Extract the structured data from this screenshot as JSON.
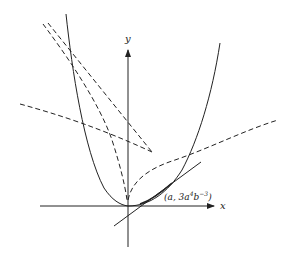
{
  "figure": {
    "axes": {
      "x_label": "x",
      "y_label": "y"
    },
    "point_label": {
      "open": "(a, 3a",
      "exp1": "4",
      "mid": "b",
      "exp2": "−3",
      "close": ")"
    },
    "elements": [
      {
        "name": "parabola-curve",
        "style": "solid"
      },
      {
        "name": "tangent-line",
        "style": "solid"
      },
      {
        "name": "dashed-curve-right",
        "style": "dashed"
      },
      {
        "name": "dashed-curve-left-inner",
        "style": "dashed"
      },
      {
        "name": "dashed-line-upper",
        "style": "dashed"
      },
      {
        "name": "dashed-line-left",
        "style": "dashed"
      }
    ],
    "colors": {
      "ink": "#222222",
      "background": "#ffffff"
    }
  }
}
